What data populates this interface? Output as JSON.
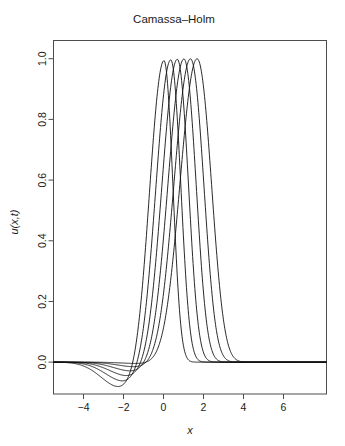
{
  "chart_data": {
    "type": "line",
    "title": "Camassa–Holm",
    "xlabel": "x",
    "ylabel": "u(x,t)",
    "xlim": [
      -5.5,
      8.15
    ],
    "ylim": [
      -0.105,
      1.06
    ],
    "grid": false,
    "legend": null,
    "xticks": [
      -4,
      -2,
      0,
      2,
      4,
      6
    ],
    "xticklabels": [
      "−4",
      "−2",
      "0",
      "2",
      "4",
      "6"
    ],
    "yticks": [
      0.0,
      0.2,
      0.4,
      0.6,
      0.8,
      1.0
    ],
    "yticklabels": [
      "0.0",
      "0.2",
      "0.4",
      "0.6",
      "0.8",
      "1.0"
    ],
    "line_color": "#111111",
    "n_series": 6,
    "series": [
      {
        "name": "t0",
        "peak_x": 0.02,
        "peak_y": 1.0,
        "undershoot_min": -0.083,
        "undershoot_x": -2.15,
        "left_width": 1.02,
        "right_width": 0.66
      },
      {
        "name": "t1",
        "peak_x": 0.36,
        "peak_y": 1.0,
        "undershoot_min": -0.064,
        "undershoot_x": -1.92,
        "left_width": 1.06,
        "right_width": 0.74
      },
      {
        "name": "t2",
        "peak_x": 0.69,
        "peak_y": 1.0,
        "undershoot_min": -0.046,
        "undershoot_x": -1.72,
        "left_width": 1.1,
        "right_width": 0.82
      },
      {
        "name": "t3",
        "peak_x": 1.02,
        "peak_y": 1.0,
        "undershoot_min": -0.03,
        "undershoot_x": -1.52,
        "left_width": 1.14,
        "right_width": 0.9
      },
      {
        "name": "t4",
        "peak_x": 1.35,
        "peak_y": 1.0,
        "undershoot_min": -0.016,
        "undershoot_x": -1.3,
        "left_width": 1.18,
        "right_width": 0.98
      },
      {
        "name": "t5",
        "peak_x": 1.68,
        "peak_y": 1.0,
        "undershoot_min": -0.005,
        "undershoot_x": -1.05,
        "left_width": 1.22,
        "right_width": 1.06
      }
    ]
  }
}
